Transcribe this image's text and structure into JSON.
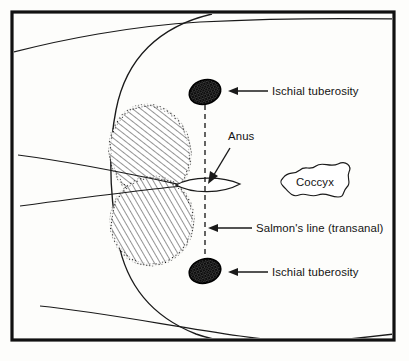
{
  "figure": {
    "frame_color": "#111111",
    "background_color": "#fdfdfb",
    "line_color": "#1a1a1a"
  },
  "labels": {
    "ischial_tuberosity_top": "Ischial tuberosity",
    "ischial_tuberosity_bottom": "Ischial tuberosity",
    "anus": "Anus",
    "salmons_line": "Salmon's line (transanal)",
    "coccyx": "Coccyx"
  },
  "structures": {
    "tuberosity_fill": "#2b2b2b",
    "hatch_fill": "#ffffff",
    "hatch_stroke": "#111111",
    "anus_fill": "#ffffff",
    "dashed_line_label": "Salmon's line (transanal)"
  },
  "icons": {
    "arrow_top": "arrow-left-icon",
    "arrow_bottom": "arrow-left-icon",
    "arrow_salmon": "arrow-left-icon",
    "arrow_anus": "arrow-down-left-icon"
  }
}
